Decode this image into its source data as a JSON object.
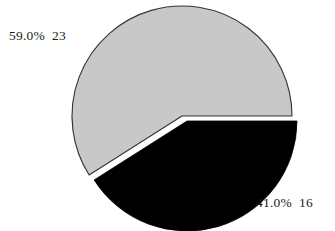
{
  "chart_data": {
    "type": "pie",
    "title": "",
    "categories": [
      "Category 1",
      "Category 2"
    ],
    "values": [
      23,
      16
    ],
    "percentages": [
      59.0,
      41.0
    ],
    "total": 39,
    "slices": [
      {
        "label": "59.0%  23",
        "percent_text": "59.0%",
        "count_text": "23",
        "percent": 59.0,
        "value": 23,
        "color": "#c8c8c8",
        "exploded": false,
        "start_angle_deg": 0.0,
        "end_angle_deg": 212.4,
        "label_position": "top-left"
      },
      {
        "label": "41.0%  16",
        "percent_text": "41.0%",
        "count_text": "16",
        "percent": 41.0,
        "value": 16,
        "color": "#000000",
        "exploded": true,
        "start_angle_deg": 212.4,
        "end_angle_deg": 360.0,
        "label_position": "bottom-right"
      }
    ],
    "legend": null,
    "legend_position": "none",
    "grid": false,
    "background_color": "#ffffff",
    "label_color": "#1a1a1a",
    "outline_color": "#333333",
    "start_angle_deg": 0,
    "direction": "counterclockwise",
    "geometry": {
      "center_x": 182,
      "center_y": 116,
      "radius": 110,
      "explode_offset_x": 5,
      "explode_offset_y": 5
    }
  }
}
